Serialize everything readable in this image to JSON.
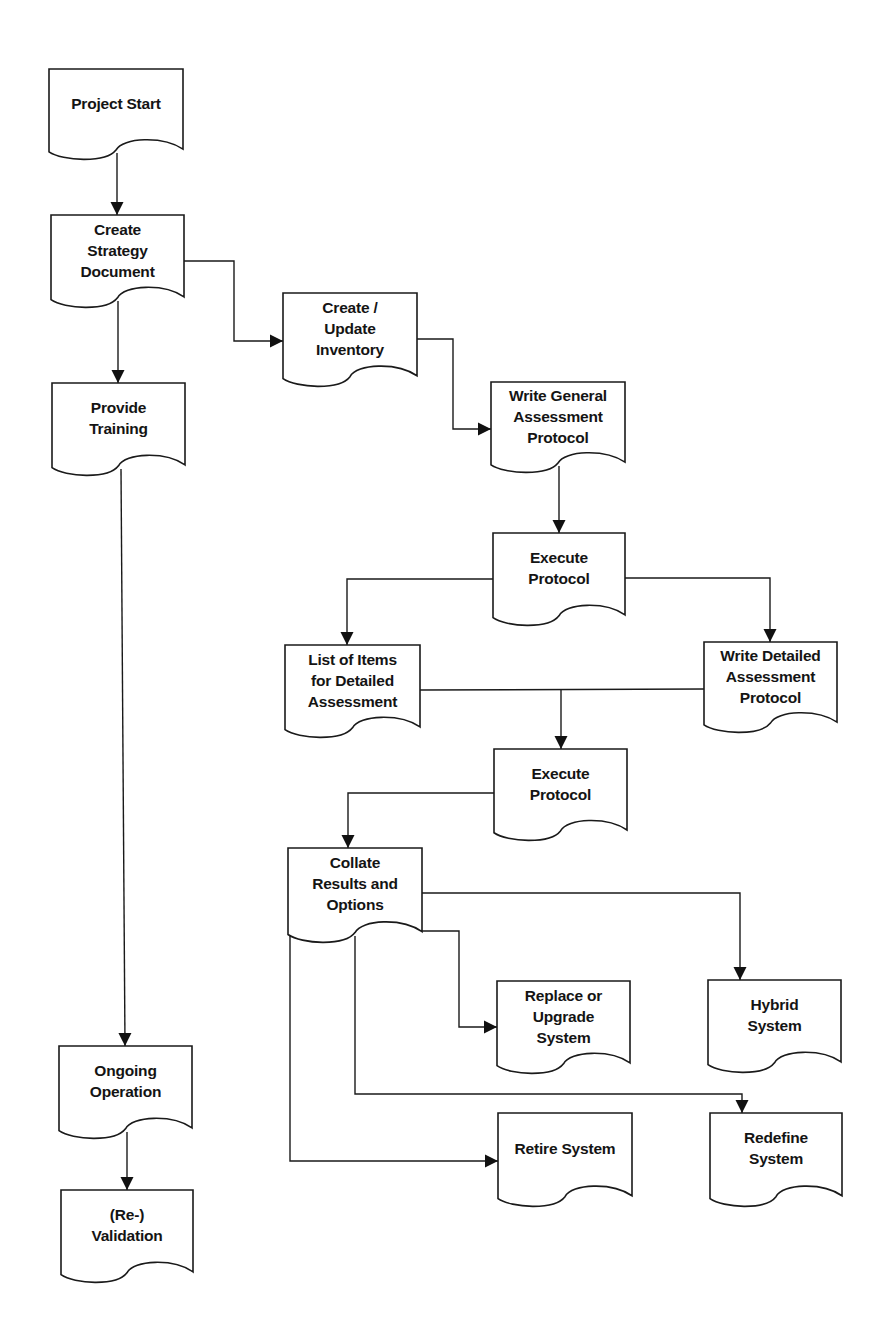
{
  "diagram": {
    "type": "flowchart",
    "shape_style": "document",
    "colors": {
      "stroke": "#1a1a1a",
      "fill": "#ffffff",
      "text": "#141414",
      "background": "#ffffff"
    },
    "top_cutoff_text": "",
    "nodes": [
      {
        "id": "project-start",
        "label": "Project Start",
        "x": 49,
        "y": 69,
        "w": 134,
        "h": 90
      },
      {
        "id": "create-strategy-document",
        "label": "Create\nStrategy\nDocument",
        "x": 51,
        "y": 215,
        "w": 133,
        "h": 92
      },
      {
        "id": "provide-training",
        "label": "Provide\nTraining",
        "x": 52,
        "y": 383,
        "w": 133,
        "h": 92
      },
      {
        "id": "create-update-inventory",
        "label": "Create /\nUpdate\nInventory",
        "x": 283,
        "y": 293,
        "w": 134,
        "h": 93
      },
      {
        "id": "write-general-assessment-protocol",
        "label": "Write General\nAssessment\nProtocol",
        "x": 491,
        "y": 382,
        "w": 134,
        "h": 90
      },
      {
        "id": "execute-protocol-1",
        "label": "Execute\nProtocol",
        "x": 493,
        "y": 533,
        "w": 132,
        "h": 92
      },
      {
        "id": "list-of-items-for-detailed-assessment",
        "label": "List of Items\nfor Detailed\nAssessment",
        "x": 285,
        "y": 645,
        "w": 135,
        "h": 92
      },
      {
        "id": "write-detailed-assessment-protocol",
        "label": "Write Detailed\nAssessment\nProtocol",
        "x": 704,
        "y": 642,
        "w": 133,
        "h": 90
      },
      {
        "id": "execute-protocol-2",
        "label": "Execute\nProtocol",
        "x": 494,
        "y": 749,
        "w": 133,
        "h": 91
      },
      {
        "id": "collate-results-and-options",
        "label": "Collate\nResults and\nOptions",
        "x": 288,
        "y": 848,
        "w": 134,
        "h": 94
      },
      {
        "id": "replace-or-upgrade-system",
        "label": "Replace or\nUpgrade\nSystem",
        "x": 497,
        "y": 981,
        "w": 133,
        "h": 92
      },
      {
        "id": "hybrid-system",
        "label": "Hybrid\nSystem",
        "x": 708,
        "y": 980,
        "w": 133,
        "h": 92
      },
      {
        "id": "retire-system",
        "label": "Retire System",
        "x": 498,
        "y": 1113,
        "w": 134,
        "h": 93
      },
      {
        "id": "redefine-system",
        "label": "Redefine\nSystem",
        "x": 710,
        "y": 1113,
        "w": 132,
        "h": 93
      },
      {
        "id": "ongoing-operation",
        "label": "Ongoing\nOperation",
        "x": 59,
        "y": 1046,
        "w": 133,
        "h": 92
      },
      {
        "id": "re-validation",
        "label": "(Re-)\nValidation",
        "x": 61,
        "y": 1190,
        "w": 132,
        "h": 92
      }
    ],
    "edges": [
      {
        "from": "project-start",
        "to": "create-strategy-document",
        "points": [
          [
            117,
            153
          ],
          [
            117,
            215
          ]
        ],
        "arrow": true
      },
      {
        "from": "create-strategy-document",
        "to": "provide-training",
        "points": [
          [
            118,
            301
          ],
          [
            118,
            383
          ]
        ],
        "arrow": true
      },
      {
        "from": "create-strategy-document",
        "to": "create-update-inventory",
        "points": [
          [
            184,
            261
          ],
          [
            234,
            261
          ],
          [
            234,
            341
          ],
          [
            283,
            341
          ]
        ],
        "arrow": true
      },
      {
        "from": "create-update-inventory",
        "to": "write-general-assessment-protocol",
        "points": [
          [
            417,
            339
          ],
          [
            453,
            339
          ],
          [
            453,
            429
          ],
          [
            491,
            429
          ]
        ],
        "arrow": true
      },
      {
        "from": "write-general-assessment-protocol",
        "to": "execute-protocol-1",
        "points": [
          [
            559,
            466
          ],
          [
            559,
            533
          ]
        ],
        "arrow": true
      },
      {
        "from": "execute-protocol-1",
        "to": "list-of-items-for-detailed-assessment",
        "points": [
          [
            493,
            579
          ],
          [
            347,
            579
          ],
          [
            347,
            645
          ]
        ],
        "arrow": true
      },
      {
        "from": "execute-protocol-1",
        "to": "write-detailed-assessment-protocol",
        "points": [
          [
            625,
            578
          ],
          [
            770,
            578
          ],
          [
            770,
            642
          ]
        ],
        "arrow": true
      },
      {
        "from": "list-of-items-for-detailed-assessment",
        "to": "write-detailed-assessment-protocol",
        "points": [
          [
            420,
            690
          ],
          [
            704,
            689
          ]
        ],
        "arrow": false
      },
      {
        "from": "detail-junction",
        "to": "execute-protocol-2",
        "points": [
          [
            561,
            690
          ],
          [
            561,
            749
          ]
        ],
        "arrow": true
      },
      {
        "from": "execute-protocol-2",
        "to": "collate-results-and-options",
        "points": [
          [
            494,
            793
          ],
          [
            348,
            793
          ],
          [
            348,
            848
          ]
        ],
        "arrow": true
      },
      {
        "from": "collate-results-and-options",
        "to": "hybrid-system",
        "points": [
          [
            422,
            893
          ],
          [
            740,
            893
          ],
          [
            740,
            980
          ]
        ],
        "arrow": true
      },
      {
        "from": "collate-results-and-options",
        "to": "replace-or-upgrade-system",
        "points": [
          [
            422,
            931
          ],
          [
            459,
            931
          ],
          [
            459,
            1027
          ],
          [
            497,
            1027
          ]
        ],
        "arrow": true
      },
      {
        "from": "collate-results-and-options",
        "to": "redefine-system",
        "points": [
          [
            355,
            936
          ],
          [
            355,
            1094
          ],
          [
            742,
            1094
          ],
          [
            742,
            1113
          ]
        ],
        "arrow": true
      },
      {
        "from": "collate-results-and-options",
        "to": "retire-system",
        "points": [
          [
            290,
            935
          ],
          [
            290,
            1161
          ],
          [
            498,
            1161
          ]
        ],
        "arrow": true
      },
      {
        "from": "provide-training",
        "to": "ongoing-operation",
        "points": [
          [
            121,
            469
          ],
          [
            125,
            1046
          ]
        ],
        "arrow": true
      },
      {
        "from": "ongoing-operation",
        "to": "re-validation",
        "points": [
          [
            127,
            1132
          ],
          [
            127,
            1190
          ]
        ],
        "arrow": true
      }
    ]
  }
}
